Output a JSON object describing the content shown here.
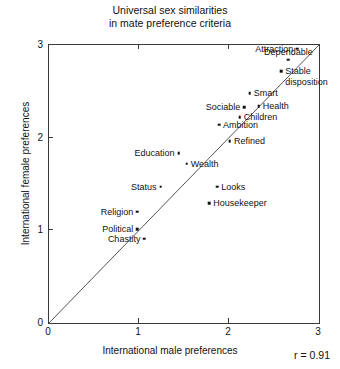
{
  "chart_data": {
    "type": "scatter",
    "title": "Universal sex similarities in mate preference criteria",
    "title_lines": [
      "Universal sex similarities",
      "in mate preference criteria"
    ],
    "xlabel": "International male preferences",
    "ylabel": "International female preferences",
    "xlim": [
      0,
      3
    ],
    "ylim": [
      0,
      3
    ],
    "xticks": [
      "0",
      "1",
      "2",
      "3"
    ],
    "yticks": [
      "0",
      "1",
      "2",
      "3"
    ],
    "xtick_values": [
      0,
      1,
      2,
      3
    ],
    "ytick_values": [
      0,
      1,
      2,
      3
    ],
    "grid": false,
    "legend": null,
    "annotations": [
      {
        "text": "r = 0.91",
        "position": "bottom-right-inside-axes"
      }
    ],
    "reference_line": {
      "type": "identity",
      "label": "y = x diagonal",
      "from": [
        0,
        0
      ],
      "to": [
        3,
        3
      ]
    },
    "points": [
      {
        "label": "Attraction",
        "x": 2.76,
        "y": 2.96,
        "label_side": "left"
      },
      {
        "label": "Dependable",
        "x": 2.66,
        "y": 2.84,
        "label_side": "above"
      },
      {
        "label": "Stable",
        "x": 2.58,
        "y": 2.72,
        "label_side": "right"
      },
      {
        "label": "disposition",
        "x": 2.58,
        "y": 2.6,
        "label_side": "right",
        "continuation": true
      },
      {
        "label": "Smart",
        "x": 2.23,
        "y": 2.48,
        "label_side": "right"
      },
      {
        "label": "Health",
        "x": 2.33,
        "y": 2.34,
        "label_side": "right"
      },
      {
        "label": "Sociable",
        "x": 2.17,
        "y": 2.33,
        "label_side": "left"
      },
      {
        "label": "Children",
        "x": 2.12,
        "y": 2.22,
        "label_side": "right"
      },
      {
        "label": "Ambition",
        "x": 1.89,
        "y": 2.14,
        "label_side": "right"
      },
      {
        "label": "Refined",
        "x": 2.01,
        "y": 1.96,
        "label_side": "right"
      },
      {
        "label": "Education",
        "x": 1.44,
        "y": 1.83,
        "label_side": "left"
      },
      {
        "label": "Wealth",
        "x": 1.53,
        "y": 1.72,
        "label_side": "right"
      },
      {
        "label": "Status",
        "x": 1.24,
        "y": 1.47,
        "label_side": "left"
      },
      {
        "label": "Looks",
        "x": 1.87,
        "y": 1.47,
        "label_side": "right"
      },
      {
        "label": "Housekeeper",
        "x": 1.78,
        "y": 1.29,
        "label_side": "right"
      },
      {
        "label": "Religion",
        "x": 0.98,
        "y": 1.2,
        "label_side": "left"
      },
      {
        "label": "Political",
        "x": 0.98,
        "y": 1.01,
        "label_side": "left"
      },
      {
        "label": "Chastity",
        "x": 1.06,
        "y": 0.91,
        "label_side": "left"
      }
    ]
  },
  "style": {
    "axis_color": "#3a3a3a",
    "marker_color": "#111111",
    "text_color": "#111111",
    "background": "#ffffff"
  }
}
